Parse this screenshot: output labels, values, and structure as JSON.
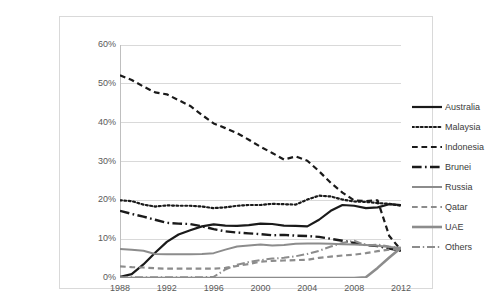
{
  "chart_data": {
    "type": "line",
    "title": "",
    "xlabel": "",
    "ylabel": "",
    "xlim": [
      1988,
      2012
    ],
    "ylim": [
      0,
      60
    ],
    "grid": true,
    "legend_position": "right",
    "x": [
      1988,
      1989,
      1990,
      1991,
      1992,
      1993,
      1994,
      1995,
      1996,
      1997,
      1998,
      1999,
      2000,
      2001,
      2002,
      2003,
      2004,
      2005,
      2006,
      2007,
      2008,
      2009,
      2010,
      2011,
      2012
    ],
    "y_tick_labels": [
      "0%",
      "10%",
      "20%",
      "30%",
      "40%",
      "50%",
      "60%"
    ],
    "y_tick_values": [
      0,
      10,
      20,
      30,
      40,
      50,
      60
    ],
    "x_tick_labels": [
      "1988",
      "1992",
      "1996",
      "2000",
      "2004",
      "2008",
      "2012"
    ],
    "x_tick_values": [
      1988,
      1992,
      1996,
      2000,
      2004,
      2008,
      2012
    ],
    "series": [
      {
        "name": "Australia",
        "style": "solid",
        "color": "#1a1a1a",
        "width": 2.2,
        "values": [
          0.3,
          1.0,
          3.5,
          6.5,
          9.3,
          11.2,
          12.3,
          13.3,
          13.8,
          13.5,
          13.4,
          13.6,
          14.0,
          13.9,
          13.5,
          13.4,
          13.3,
          15.0,
          17.3,
          18.8,
          18.6,
          18.0,
          18.2,
          19.0,
          18.8
        ]
      },
      {
        "name": "Malaysia",
        "style": "dotted",
        "color": "#1a1a1a",
        "width": 2.2,
        "values": [
          20.0,
          19.8,
          18.9,
          18.4,
          18.7,
          18.6,
          18.6,
          18.4,
          18.0,
          18.2,
          18.6,
          18.8,
          18.8,
          19.1,
          19.0,
          18.9,
          20.2,
          21.2,
          21.0,
          20.2,
          19.7,
          19.6,
          19.3,
          19.1,
          18.6
        ]
      },
      {
        "name": "Indonesia",
        "style": "dashed",
        "color": "#1a1a1a",
        "width": 2.2,
        "values": [
          52.2,
          51.0,
          49.3,
          47.8,
          47.3,
          45.8,
          44.3,
          42.0,
          39.8,
          38.6,
          37.3,
          35.6,
          33.8,
          32.2,
          30.5,
          31.3,
          30.2,
          27.5,
          24.5,
          22.0,
          20.0,
          19.8,
          20.0,
          10.8,
          7.2
        ]
      },
      {
        "name": "Brunei",
        "style": "longdash-dot",
        "color": "#1a1a1a",
        "width": 2.4,
        "values": [
          17.3,
          16.5,
          15.8,
          15.0,
          14.2,
          14.0,
          13.9,
          13.3,
          12.6,
          12.0,
          11.7,
          11.5,
          11.3,
          11.0,
          11.1,
          10.9,
          10.8,
          10.6,
          10.1,
          9.6,
          9.0,
          8.5,
          8.2,
          7.6,
          7.0
        ]
      },
      {
        "name": "Russia",
        "style": "solid",
        "color": "#8c8c8c",
        "width": 2.0,
        "values": [
          7.5,
          7.3,
          7.0,
          6.2,
          6.1,
          6.1,
          6.1,
          6.2,
          6.4,
          7.3,
          8.1,
          8.4,
          8.6,
          8.4,
          8.5,
          8.8,
          8.9,
          8.9,
          8.8,
          8.7,
          8.6,
          8.5,
          8.3,
          8.0,
          7.7
        ]
      },
      {
        "name": "Qatar",
        "style": "dashed",
        "color": "#8c8c8c",
        "width": 2.2,
        "values": [
          3.0,
          2.8,
          2.7,
          2.5,
          2.4,
          2.4,
          2.4,
          2.4,
          2.4,
          2.6,
          3.1,
          3.6,
          4.2,
          4.4,
          4.5,
          4.6,
          4.7,
          5.2,
          5.5,
          5.8,
          6.0,
          6.4,
          6.9,
          7.3,
          7.6
        ]
      },
      {
        "name": "UAE",
        "style": "solid",
        "color": "#8c8c8c",
        "width": 2.6,
        "values": [
          0,
          0,
          0,
          0,
          0,
          0,
          0,
          0,
          0,
          0,
          0,
          0,
          0,
          0,
          0,
          0,
          0,
          0,
          0,
          0,
          0,
          0.2,
          2.6,
          5.3,
          7.8
        ]
      },
      {
        "name": "Others",
        "style": "longdash-dot",
        "color": "#8c8c8c",
        "width": 2.0,
        "values": [
          0.2,
          0.2,
          0.2,
          0.2,
          0.2,
          0.2,
          0.2,
          0.2,
          0.3,
          2.2,
          3.4,
          4.1,
          4.6,
          5.0,
          5.2,
          5.6,
          6.2,
          7.0,
          8.1,
          9.0,
          9.6,
          8.4,
          8.6,
          8.1,
          7.8
        ]
      }
    ]
  },
  "legend": {
    "items": [
      {
        "label": "Australia"
      },
      {
        "label": "Malaysia"
      },
      {
        "label": "Indonesia"
      },
      {
        "label": "Brunei"
      },
      {
        "label": "Russia"
      },
      {
        "label": "Qatar"
      },
      {
        "label": "UAE"
      },
      {
        "label": "Others"
      }
    ]
  },
  "colors": {
    "series_dark": "#1a1a1a",
    "series_gray": "#8c8c8c",
    "gridline": "#d9d9d9",
    "axis": "#bfbfbf",
    "tick_text": "#595959",
    "frame_border": "#d9d9d9",
    "background": "#ffffff"
  }
}
